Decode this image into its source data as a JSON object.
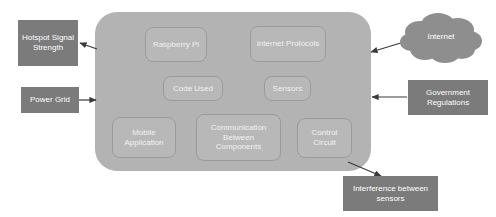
{
  "diagram": {
    "colors": {
      "container_fill": "#b3b3b3",
      "inner_box_fill": "#b8b8b8",
      "inner_box_border": "#9a9a9a",
      "external_box_fill": "#7b7b7b",
      "cloud_fill": "#8e8e8e",
      "text_light": "#ffffff",
      "arrow": "#3a3a3a",
      "background": "#ffffff"
    },
    "container": {
      "name": "system-container",
      "label": ""
    },
    "inner_nodes": [
      {
        "id": "raspberry-pi",
        "label": "Raspberry Pi"
      },
      {
        "id": "internet-protocols",
        "label": "Internet Protocols"
      },
      {
        "id": "code-used",
        "label": "Code Used"
      },
      {
        "id": "sensors",
        "label": "Sensors"
      },
      {
        "id": "mobile-application",
        "label": "Mobile Application"
      },
      {
        "id": "communication-between-components",
        "label": "Communication Between Components"
      },
      {
        "id": "control-circuit",
        "label": "Control Circuit"
      }
    ],
    "external_nodes": [
      {
        "id": "hotspot-signal-strength",
        "label": "Hotspot Signal Strength",
        "shape": "rectangle"
      },
      {
        "id": "power-grid",
        "label": "Power Grid",
        "shape": "rectangle"
      },
      {
        "id": "internet",
        "label": "Internet",
        "shape": "cloud"
      },
      {
        "id": "government-regulations",
        "label": "Government Regulations",
        "shape": "rectangle"
      },
      {
        "id": "interference-between-sensors",
        "label": "Interference between sensors",
        "shape": "rectangle"
      }
    ],
    "connections": [
      {
        "from": "system-container",
        "to": "hotspot-signal-strength",
        "type": "arrow"
      },
      {
        "from": "power-grid",
        "to": "system-container",
        "type": "arrow"
      },
      {
        "from": "internet",
        "to": "system-container",
        "type": "arrow"
      },
      {
        "from": "government-regulations",
        "to": "system-container",
        "type": "arrow"
      },
      {
        "from": "system-container",
        "to": "interference-between-sensors",
        "type": "arrow"
      }
    ]
  }
}
